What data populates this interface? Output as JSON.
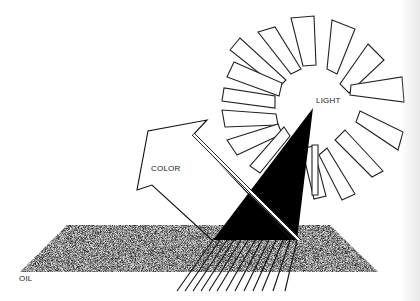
{
  "labels": {
    "light": "LIGHT",
    "color": "COLOR",
    "oil": "OIL"
  },
  "colors": {
    "ink": "#111111",
    "paper": "#ffffff",
    "oil_speckle_dark": "#3a3a3a",
    "oil_speckle_light": "#c8c8c8"
  },
  "elements": {
    "sun": {
      "center": [
        338,
        108
      ],
      "ray_count": 16
    },
    "light_beam": "black triangle from sun center down to oil surface",
    "reflected_arrow": "outlined arrow pointing up-left labeled COLOR",
    "oil_slab": "speckled parallelogram labeled OIL",
    "refracted_rays": 13
  }
}
